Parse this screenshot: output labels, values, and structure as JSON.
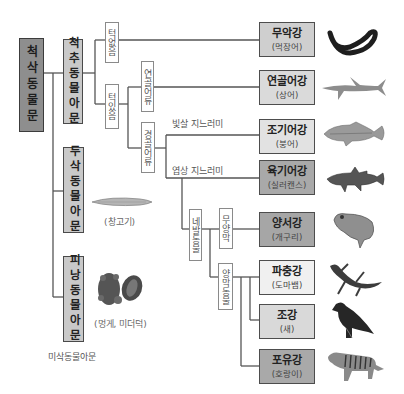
{
  "diagram": {
    "root": "척삭동물문",
    "subphyla": {
      "vertebrata": "척추동물아문",
      "cephalochordata": "두삭동물아문",
      "urochordata": "피낭동물아문"
    },
    "examples": {
      "cephalochordata": "(창고기)",
      "urochordata": "(멍게, 미더덕)"
    },
    "urochordata_caption": "미삭동물아문",
    "branches": {
      "jawless": "턱없음",
      "jawed": "턱있음",
      "cartilaginous_fish": "연골어류",
      "bony_fish": "경골어류",
      "ray_finned": "빛살 지느러미",
      "lobe_finned": "엽상 지느러미",
      "tetrapods": "네발동물",
      "anamniotes": "무양막",
      "amniotes": "양막동물"
    },
    "classes": [
      {
        "name": "무악강",
        "example": "(먹장어)",
        "fill": "#cfcfcf",
        "animal": "hagfish-icon"
      },
      {
        "name": "연골어강",
        "example": "(상어)",
        "fill": "#dadada",
        "animal": "shark-icon"
      },
      {
        "name": "조기어강",
        "example": "(붕어)",
        "fill": "#e2e2e2",
        "animal": "croaker-icon"
      },
      {
        "name": "육기어강",
        "example": "(실러캔스)",
        "fill": "#a9a9a9",
        "animal": "coelacanth-icon"
      },
      {
        "name": "양서강",
        "example": "(개구리)",
        "fill": "#a6a6a6",
        "animal": "frog-icon"
      },
      {
        "name": "파충강",
        "example": "(도마뱀)",
        "fill": "#f0f0f0",
        "animal": "lizard-icon"
      },
      {
        "name": "조강",
        "example": "(새)",
        "fill": "#d9d9d9",
        "animal": "eagle-icon"
      },
      {
        "name": "포유강",
        "example": "(호랑이)",
        "fill": "#a9a9a9",
        "animal": "tiger-icon"
      }
    ]
  }
}
